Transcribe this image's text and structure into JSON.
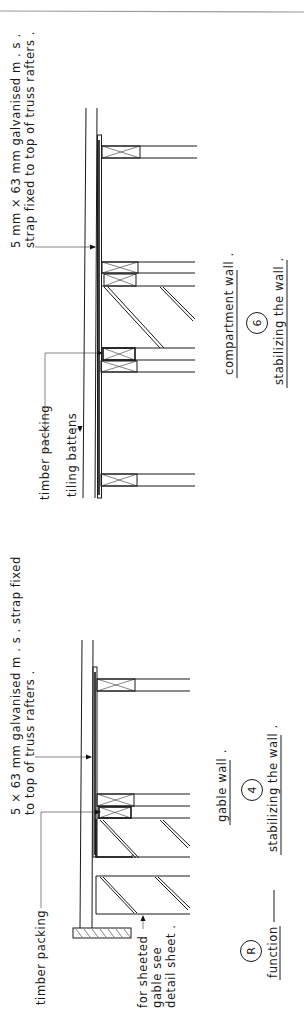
{
  "drawing": {
    "orientation": "rotated 90deg counter-clockwise",
    "separator_color": "#9a9a9a",
    "line_color": "#1a1a1a"
  },
  "top_detail": {
    "strap_note_line1": "5 mm × 63 mm  galvanised  m . s .",
    "strap_note_line2": "strap  fixed  to  top  of  truss  rafters .",
    "timber_packing_label": "timber  packing",
    "tiling_battens_label": "tiling  battens",
    "wall_type_label": "compartment  wall .",
    "detail_number": "6",
    "caption": "stabilizing  the  wall ."
  },
  "bottom_detail": {
    "strap_note_line1": "5 × 63 mm  galvanised  m . s .  strap  fixed",
    "strap_note_line2": "to  top  of  truss  rafters .",
    "timber_packing_label": "timber  packing",
    "sheeted_gable_line1": "for  sheeted",
    "sheeted_gable_line2": "gable  see",
    "sheeted_gable_line3": "detail  sheet .",
    "wall_type_label": "gable  wall .",
    "detail_number": "4",
    "caption": "stabilizing  the  wall ."
  },
  "legend": {
    "symbol": "R",
    "label": "function"
  }
}
